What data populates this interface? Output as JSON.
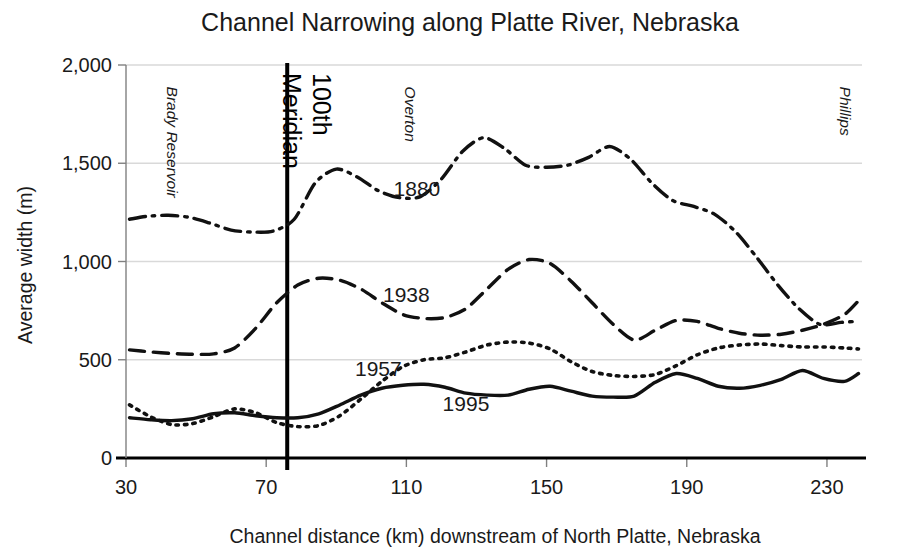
{
  "chart_data": {
    "type": "line",
    "title": "Channel Narrowing along Platte River, Nebraska",
    "xlabel": "Channel distance (km) downstream of North Platte, Nebraska",
    "ylabel": "Average width (m)",
    "xlim": [
      30,
      240
    ],
    "ylim": [
      0,
      2000
    ],
    "xticks": [
      30,
      70,
      110,
      150,
      190,
      230
    ],
    "xtick_labels": [
      "30",
      "70",
      "110",
      "150",
      "190",
      "230"
    ],
    "yticks": [
      0,
      500,
      1000,
      1500,
      2000
    ],
    "ytick_labels": [
      "0",
      "500",
      "1,000",
      "1,500",
      "2,000"
    ],
    "grid": "horizontal",
    "legend_position": "inline-labels",
    "series": [
      {
        "name": "1880",
        "style": "dash-dot",
        "label_x": 113,
        "label_y": 1370,
        "x": [
          31,
          36,
          42,
          48,
          54,
          60,
          66,
          72,
          78,
          84,
          90,
          96,
          102,
          108,
          114,
          120,
          126,
          132,
          138,
          144,
          150,
          156,
          162,
          168,
          174,
          180,
          186,
          192,
          198,
          204,
          210,
          216,
          222,
          228,
          234,
          238
        ],
        "y": [
          1215,
          1230,
          1235,
          1225,
          1195,
          1160,
          1150,
          1155,
          1215,
          1400,
          1470,
          1430,
          1360,
          1325,
          1330,
          1420,
          1560,
          1630,
          1575,
          1490,
          1480,
          1490,
          1530,
          1585,
          1520,
          1400,
          1310,
          1280,
          1240,
          1150,
          1020,
          880,
          760,
          680,
          690,
          695
        ]
      },
      {
        "name": "1938",
        "style": "dashed",
        "label_x": 110,
        "label_y": 830,
        "x": [
          31,
          37,
          43,
          49,
          55,
          61,
          67,
          73,
          79,
          85,
          91,
          97,
          103,
          109,
          115,
          121,
          127,
          133,
          139,
          145,
          151,
          157,
          163,
          169,
          175,
          181,
          187,
          193,
          199,
          205,
          211,
          217,
          223,
          229,
          235,
          239
        ],
        "y": [
          550,
          540,
          532,
          528,
          530,
          560,
          660,
          790,
          880,
          915,
          905,
          860,
          790,
          730,
          710,
          715,
          760,
          860,
          960,
          1010,
          990,
          900,
          790,
          680,
          600,
          650,
          700,
          695,
          660,
          635,
          625,
          630,
          650,
          680,
          730,
          800
        ]
      },
      {
        "name": "1957",
        "style": "dotted",
        "label_x": 102,
        "label_y": 455,
        "x": [
          31,
          37,
          43,
          49,
          55,
          61,
          67,
          73,
          79,
          85,
          91,
          97,
          103,
          109,
          115,
          121,
          127,
          133,
          139,
          145,
          151,
          157,
          163,
          169,
          175,
          181,
          187,
          193,
          199,
          205,
          211,
          217,
          223,
          229,
          235,
          239
        ],
        "y": [
          270,
          210,
          170,
          175,
          210,
          250,
          230,
          180,
          160,
          165,
          215,
          300,
          390,
          465,
          500,
          510,
          540,
          575,
          590,
          585,
          555,
          490,
          440,
          420,
          415,
          425,
          470,
          525,
          560,
          575,
          580,
          572,
          565,
          565,
          560,
          555
        ]
      },
      {
        "name": "1995",
        "style": "solid",
        "label_x": 127,
        "label_y": 275,
        "x": [
          31,
          37,
          43,
          49,
          55,
          61,
          67,
          73,
          79,
          85,
          91,
          97,
          103,
          109,
          115,
          121,
          127,
          133,
          139,
          145,
          151,
          157,
          163,
          169,
          175,
          181,
          187,
          193,
          199,
          205,
          211,
          217,
          223,
          229,
          235,
          239
        ],
        "y": [
          205,
          195,
          190,
          200,
          225,
          230,
          215,
          205,
          205,
          225,
          270,
          320,
          355,
          370,
          375,
          360,
          330,
          320,
          320,
          350,
          365,
          340,
          315,
          310,
          315,
          385,
          430,
          405,
          365,
          355,
          370,
          400,
          445,
          405,
          390,
          430
        ]
      }
    ],
    "markers": [
      {
        "id": "hundredth-meridian",
        "label": "100th",
        "label2": "Meridian",
        "x": 76,
        "style": "vertical-rule-bold"
      }
    ],
    "places": [
      {
        "id": "brady-reservoir",
        "label": "Brady Reservoir",
        "x": 40,
        "y_top": 1890
      },
      {
        "id": "overton",
        "label": "Overton",
        "x": 108,
        "y_top": 1890
      },
      {
        "id": "phillips",
        "label": "Phillips",
        "x": 232,
        "y_top": 1890
      }
    ],
    "colors": {
      "line": "#111111",
      "grid": "#d9d9d9",
      "axis": "#000000",
      "text": "#1a1a1a",
      "background": "#ffffff"
    }
  }
}
